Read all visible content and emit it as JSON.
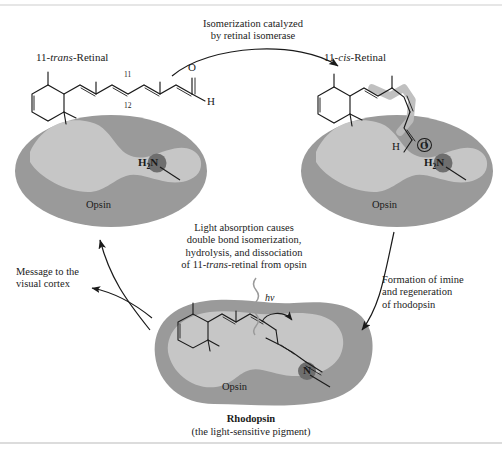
{
  "figure": {
    "title_hidden": "Rhodopsin visual cycle",
    "colors": {
      "opsin_body": "#9a9a9a",
      "opsin_pocket": "#c6c6c6",
      "highlight_circle": "#6e6e6e",
      "cis_highlight": "#bdbdbd",
      "line": "#1a1a1a",
      "rule": "#b9b9b9",
      "background": "#ffffff"
    }
  },
  "labels": {
    "trans_retinal": {
      "prefix": "11-",
      "italic": "trans",
      "suffix": "-Retinal"
    },
    "cis_retinal": {
      "prefix": "11-",
      "italic": "cis",
      "suffix": "-Retinal"
    },
    "opsin_left": "Opsin",
    "opsin_right": "Opsin",
    "opsin_bottom": "Opsin",
    "rhodopsin": "Rhodopsin",
    "rhodopsin_sub": "(the light-sensitive pigment)",
    "photon": "hν"
  },
  "atoms": {
    "trans_O": "O",
    "trans_H": "H",
    "trans_c11": "11",
    "trans_c12": "12",
    "cis_O": "O",
    "cis_H": "H",
    "amine_left_H": "H",
    "amine_left_N": "N",
    "amine_left_sub": "2",
    "amine_right_H": "H",
    "amine_right_N": "N",
    "amine_right_sub": "2",
    "imine_N": "N"
  },
  "captions": {
    "top_arrow": [
      "Isomerization catalyzed",
      "by retinal isomerase"
    ],
    "center": [
      "Light absorption causes",
      "double bond isomerization,",
      "hydrolysis, and dissociation",
      "of 11-trans-retinal from opsin"
    ],
    "center_line4": {
      "pre": "of 11-",
      "italic": "trans",
      "post": "-retinal from opsin"
    },
    "left_arrow": [
      "Message to the",
      "visual cortex"
    ],
    "right_arrow": [
      "Formation of imine",
      "and regeneration",
      "of rhodopsin"
    ]
  }
}
